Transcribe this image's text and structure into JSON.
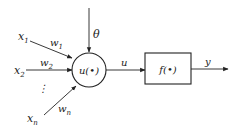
{
  "diagram": {
    "type": "neuron-model",
    "inputs": [
      {
        "label": "x",
        "sub": "1",
        "weight": "w",
        "weight_sub": "1"
      },
      {
        "label": "x",
        "sub": "2",
        "weight": "w",
        "weight_sub": "2"
      },
      {
        "label": "x",
        "sub": "n",
        "weight": "w",
        "weight_sub": "n"
      }
    ],
    "ellipsis": "⋮",
    "threshold": "θ",
    "summation_node": "u(•)",
    "intermediate": "u",
    "activation_block": "f(•)",
    "output": "y",
    "colors": {
      "stroke": "#222222",
      "background": "#ffffff"
    }
  }
}
